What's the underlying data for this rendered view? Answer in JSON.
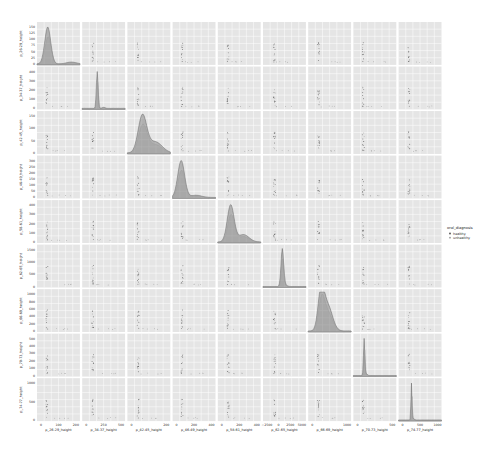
{
  "chart_data": {
    "type": "pairplot",
    "title": "",
    "variables": [
      "p_26-29_height",
      "p_34-37_height",
      "p_42-45_height",
      "p_46-49_height",
      "p_58-61_height",
      "p_62-65_height",
      "p_66-69_height",
      "p_70-73_height",
      "p_74-77_height"
    ],
    "diag_kind": "kde",
    "offdiag_kind": "scatter",
    "hue": "oral_diagnosis",
    "legend": {
      "title": "oral_diagnosis",
      "position": "right",
      "entries": [
        {
          "label": "healthy",
          "color": "#4c4c4c"
        },
        {
          "label": "unhealthy",
          "color": "#9a9a9a"
        }
      ]
    },
    "grid": true,
    "background": "#e5e5e5",
    "y_ticks": [
      [
        "0",
        "25",
        "50",
        "75",
        "100",
        "125",
        "150"
      ],
      [
        "0",
        "100",
        "200",
        "300",
        "400"
      ],
      [
        "0",
        "50",
        "100",
        "150"
      ],
      [
        "0",
        "50",
        "100",
        "150",
        "200",
        "250",
        "300"
      ],
      [
        "0",
        "100",
        "200",
        "300",
        "400"
      ],
      [
        "0",
        "500",
        "1000",
        "1500"
      ],
      [
        "0",
        "200",
        "400",
        "600",
        "800",
        "1000"
      ],
      [
        "0",
        "100",
        "200",
        "300",
        "400",
        "500"
      ],
      [
        "0",
        "500",
        "1000"
      ]
    ],
    "x_ticks": [
      [
        "0",
        "100",
        "200"
      ],
      [
        "0",
        "250",
        "500"
      ],
      [
        "0",
        "200"
      ],
      [
        "0",
        "200",
        "400"
      ],
      [
        "0",
        "200",
        "400"
      ],
      [
        "−2500",
        "0",
        "2500",
        "5000"
      ],
      [
        "0",
        "1000"
      ],
      [
        "0",
        "500"
      ],
      [
        "0",
        "500",
        "1000"
      ]
    ],
    "diagonal_kde": [
      {
        "var": "p_26-29_height",
        "peak_pos": 0.25,
        "width": 0.07,
        "secondary_pos": 0.8,
        "secondary_height": 0.05
      },
      {
        "var": "p_34-37_height",
        "peak_pos": 0.35,
        "width": 0.02,
        "secondary_pos": 0.5,
        "secondary_height": 0.03
      },
      {
        "var": "p_42-45_height",
        "peak_pos": 0.35,
        "width": 0.1,
        "secondary_pos": 0.65,
        "secondary_height": 0.3
      },
      {
        "var": "p_46-49_height",
        "peak_pos": 0.2,
        "width": 0.08,
        "secondary_pos": 0.55,
        "secondary_height": 0.06
      },
      {
        "var": "p_58-61_height",
        "peak_pos": 0.3,
        "width": 0.08,
        "secondary_pos": 0.6,
        "secondary_height": 0.2
      },
      {
        "var": "p_62-65_height",
        "peak_pos": 0.45,
        "width": 0.03,
        "secondary_pos": 0.5,
        "secondary_height": 0.05
      },
      {
        "var": "p_66-69_height",
        "peak_pos": 0.3,
        "width": 0.07,
        "secondary_pos": 0.45,
        "secondary_height": 0.7
      },
      {
        "var": "p_70-73_height",
        "peak_pos": 0.25,
        "width": 0.015,
        "secondary_pos": 0.3,
        "secondary_height": 0.05
      },
      {
        "var": "p_74-77_height",
        "peak_pos": 0.3,
        "width": 0.012,
        "secondary_pos": 0.35,
        "secondary_height": 0.04
      }
    ]
  },
  "layout": {
    "grid_left": 37,
    "grid_top": 22,
    "cell": 44.9,
    "gap": 2,
    "n": 9,
    "legend_x": 447,
    "legend_y": 229
  }
}
